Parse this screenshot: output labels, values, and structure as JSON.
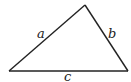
{
  "diagram": {
    "type": "triangle",
    "vertices": {
      "bottom_left": [
        9,
        71
      ],
      "top": [
        85,
        5
      ],
      "bottom_right": [
        128,
        71
      ]
    },
    "sides": [
      {
        "id": "a",
        "label": "a",
        "from": "bottom_left",
        "to": "top",
        "label_pos": [
          38,
          38
        ]
      },
      {
        "id": "b",
        "label": "b",
        "from": "top",
        "to": "bottom_right",
        "label_pos": [
          109,
          38
        ]
      },
      {
        "id": "c",
        "label": "c",
        "from": "bottom_left",
        "to": "bottom_right",
        "label_pos": [
          65,
          81
        ]
      }
    ],
    "stroke_color": "#222222"
  }
}
